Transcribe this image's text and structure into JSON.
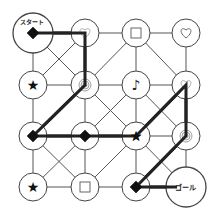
{
  "puzzle": {
    "start_label": "スタート",
    "goal_label": "ゴール",
    "grid": {
      "cols": 4,
      "rows": 4,
      "xs": [
        33,
        85,
        136,
        186
      ],
      "ys": [
        33,
        85,
        136,
        187
      ]
    },
    "nodes": [
      {
        "c": 0,
        "r": 0,
        "symbol": "diamond",
        "role": "start"
      },
      {
        "c": 1,
        "r": 0,
        "symbol": "heart-light"
      },
      {
        "c": 2,
        "r": 0,
        "symbol": "square"
      },
      {
        "c": 3,
        "r": 0,
        "symbol": "heart"
      },
      {
        "c": 0,
        "r": 1,
        "symbol": "star"
      },
      {
        "c": 1,
        "r": 1,
        "symbol": "spiral"
      },
      {
        "c": 2,
        "r": 1,
        "symbol": "note"
      },
      {
        "c": 3,
        "r": 1,
        "symbol": "heart-light"
      },
      {
        "c": 0,
        "r": 2,
        "symbol": "diamond"
      },
      {
        "c": 1,
        "r": 2,
        "symbol": "diamond"
      },
      {
        "c": 2,
        "r": 2,
        "symbol": "star"
      },
      {
        "c": 3,
        "r": 2,
        "symbol": "spiral"
      },
      {
        "c": 0,
        "r": 3,
        "symbol": "star"
      },
      {
        "c": 1,
        "r": 3,
        "symbol": "square"
      },
      {
        "c": 2,
        "r": 3,
        "symbol": "diamond"
      },
      {
        "c": 3,
        "r": 3,
        "symbol": "none",
        "role": "goal"
      }
    ],
    "edges": [
      [
        [
          0,
          0
        ],
        [
          1,
          0
        ]
      ],
      [
        [
          1,
          0
        ],
        [
          2,
          0
        ]
      ],
      [
        [
          2,
          0
        ],
        [
          3,
          0
        ]
      ],
      [
        [
          0,
          1
        ],
        [
          1,
          1
        ]
      ],
      [
        [
          1,
          1
        ],
        [
          2,
          1
        ]
      ],
      [
        [
          2,
          1
        ],
        [
          3,
          1
        ]
      ],
      [
        [
          0,
          2
        ],
        [
          1,
          2
        ]
      ],
      [
        [
          1,
          2
        ],
        [
          2,
          2
        ]
      ],
      [
        [
          2,
          2
        ],
        [
          3,
          2
        ]
      ],
      [
        [
          0,
          3
        ],
        [
          1,
          3
        ]
      ],
      [
        [
          1,
          3
        ],
        [
          2,
          3
        ]
      ],
      [
        [
          2,
          3
        ],
        [
          3,
          3
        ]
      ],
      [
        [
          0,
          0
        ],
        [
          0,
          1
        ]
      ],
      [
        [
          0,
          1
        ],
        [
          0,
          2
        ]
      ],
      [
        [
          0,
          2
        ],
        [
          0,
          3
        ]
      ],
      [
        [
          1,
          0
        ],
        [
          1,
          1
        ]
      ],
      [
        [
          1,
          1
        ],
        [
          1,
          2
        ]
      ],
      [
        [
          1,
          2
        ],
        [
          1,
          3
        ]
      ],
      [
        [
          2,
          0
        ],
        [
          2,
          1
        ]
      ],
      [
        [
          2,
          1
        ],
        [
          2,
          2
        ]
      ],
      [
        [
          2,
          2
        ],
        [
          2,
          3
        ]
      ],
      [
        [
          3,
          0
        ],
        [
          3,
          1
        ]
      ],
      [
        [
          3,
          1
        ],
        [
          3,
          2
        ]
      ],
      [
        [
          3,
          2
        ],
        [
          3,
          3
        ]
      ],
      [
        [
          0,
          0
        ],
        [
          1,
          1
        ]
      ],
      [
        [
          1,
          0
        ],
        [
          0,
          1
        ]
      ],
      [
        [
          2,
          0
        ],
        [
          1,
          1
        ]
      ],
      [
        [
          2,
          0
        ],
        [
          3,
          1
        ]
      ],
      [
        [
          1,
          1
        ],
        [
          0,
          2
        ]
      ],
      [
        [
          1,
          1
        ],
        [
          2,
          2
        ]
      ],
      [
        [
          2,
          1
        ],
        [
          1,
          2
        ]
      ],
      [
        [
          3,
          1
        ],
        [
          2,
          2
        ]
      ],
      [
        [
          2,
          1
        ],
        [
          3,
          2
        ]
      ],
      [
        [
          0,
          2
        ],
        [
          1,
          3
        ]
      ],
      [
        [
          1,
          2
        ],
        [
          0,
          3
        ]
      ],
      [
        [
          2,
          2
        ],
        [
          1,
          3
        ]
      ],
      [
        [
          2,
          2
        ],
        [
          3,
          3
        ]
      ],
      [
        [
          3,
          2
        ],
        [
          2,
          3
        ]
      ]
    ],
    "solution_path": [
      [
        0,
        0
      ],
      [
        1,
        0
      ],
      [
        1,
        1
      ],
      [
        0,
        2
      ],
      [
        1,
        2
      ],
      [
        2,
        2
      ],
      [
        3,
        1
      ],
      [
        3,
        2
      ],
      [
        2,
        3
      ],
      [
        3,
        3
      ]
    ]
  }
}
